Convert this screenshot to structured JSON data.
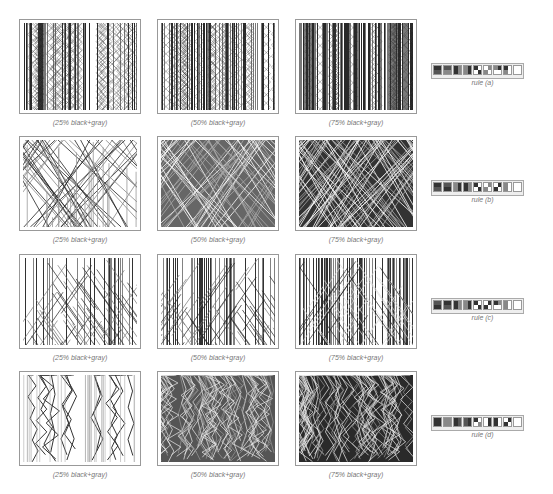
{
  "rows": [
    {
      "id": "a",
      "panels": [
        {
          "caption": "(25% black+gray)",
          "density": 0.25,
          "style": "vertical"
        },
        {
          "caption": "(50% black+gray)",
          "density": 0.5,
          "style": "vertical"
        },
        {
          "caption": "(75% black+gray)",
          "density": 0.75,
          "style": "vertical"
        }
      ],
      "rule_label": "rule (a)",
      "rule_cells": [
        [
          "#333",
          "#333",
          "#555",
          "#555"
        ],
        [
          "#555",
          "#555",
          "#888",
          "#888"
        ],
        [
          "#333",
          "#888",
          "#333",
          "#888"
        ],
        [
          "#888",
          "#333",
          "#888",
          "#333"
        ],
        [
          "#333",
          "#fff",
          "#fff",
          "#333"
        ],
        [
          "#fff",
          "#888",
          "#888",
          "#fff"
        ],
        [
          "#888",
          "#333",
          "#fff",
          "#fff"
        ],
        [
          "#333",
          "#fff",
          "#888",
          "#fff"
        ],
        [
          "#fff",
          "#fff",
          "#fff",
          "#fff"
        ]
      ]
    },
    {
      "id": "b",
      "panels": [
        {
          "caption": "(25% black+gray)",
          "density": 0.25,
          "style": "diagonal"
        },
        {
          "caption": "(50% black+gray)",
          "density": 0.5,
          "style": "diagonal"
        },
        {
          "caption": "(75% black+gray)",
          "density": 0.75,
          "style": "diagonal"
        }
      ],
      "rule_label": "rule (b)",
      "rule_cells": [
        [
          "#333",
          "#333",
          "#555",
          "#555"
        ],
        [
          "#555",
          "#555",
          "#333",
          "#333"
        ],
        [
          "#888",
          "#333",
          "#888",
          "#333"
        ],
        [
          "#333",
          "#888",
          "#333",
          "#888"
        ],
        [
          "#333",
          "#fff",
          "#fff",
          "#333"
        ],
        [
          "#fff",
          "#888",
          "#888",
          "#fff"
        ],
        [
          "#fff",
          "#333",
          "#333",
          "#fff"
        ],
        [
          "#888",
          "#fff",
          "#888",
          "#fff"
        ],
        [
          "#fff",
          "#fff",
          "#fff",
          "#fff"
        ]
      ]
    },
    {
      "id": "c",
      "panels": [
        {
          "caption": "(25% black+gray)",
          "density": 0.25,
          "style": "mixed"
        },
        {
          "caption": "(50% black+gray)",
          "density": 0.5,
          "style": "mixed"
        },
        {
          "caption": "(75% black+gray)",
          "density": 0.75,
          "style": "mixed"
        }
      ],
      "rule_label": "rule (c)",
      "rule_cells": [
        [
          "#555",
          "#555",
          "#333",
          "#333"
        ],
        [
          "#333",
          "#333",
          "#555",
          "#555"
        ],
        [
          "#333",
          "#888",
          "#333",
          "#888"
        ],
        [
          "#888",
          "#333",
          "#888",
          "#333"
        ],
        [
          "#333",
          "#fff",
          "#fff",
          "#333"
        ],
        [
          "#fff",
          "#333",
          "#333",
          "#fff"
        ],
        [
          "#333",
          "#888",
          "#fff",
          "#fff"
        ],
        [
          "#888",
          "#fff",
          "#888",
          "#fff"
        ],
        [
          "#fff",
          "#fff",
          "#fff",
          "#fff"
        ]
      ]
    },
    {
      "id": "d",
      "panels": [
        {
          "caption": "(25% black+gray)",
          "density": 0.25,
          "style": "zigzag"
        },
        {
          "caption": "(50% black+gray)",
          "density": 0.5,
          "style": "zigzag"
        },
        {
          "caption": "(75% black+gray)",
          "density": 0.75,
          "style": "zigzag"
        }
      ],
      "rule_label": "rule (d)",
      "rule_cells": [
        [
          "#333",
          "#333",
          "#333",
          "#333"
        ],
        [
          "#888",
          "#888",
          "#888",
          "#888"
        ],
        [
          "#333",
          "#555",
          "#333",
          "#555"
        ],
        [
          "#555",
          "#333",
          "#555",
          "#333"
        ],
        [
          "#333",
          "#fff",
          "#fff",
          "#888"
        ],
        [
          "#fff",
          "#333",
          "#fff",
          "#333"
        ],
        [
          "#333",
          "#fff",
          "#333",
          "#fff"
        ],
        [
          "#fff",
          "#333",
          "#333",
          "#fff"
        ],
        [
          "#fff",
          "#fff",
          "#fff",
          "#fff"
        ]
      ]
    }
  ]
}
